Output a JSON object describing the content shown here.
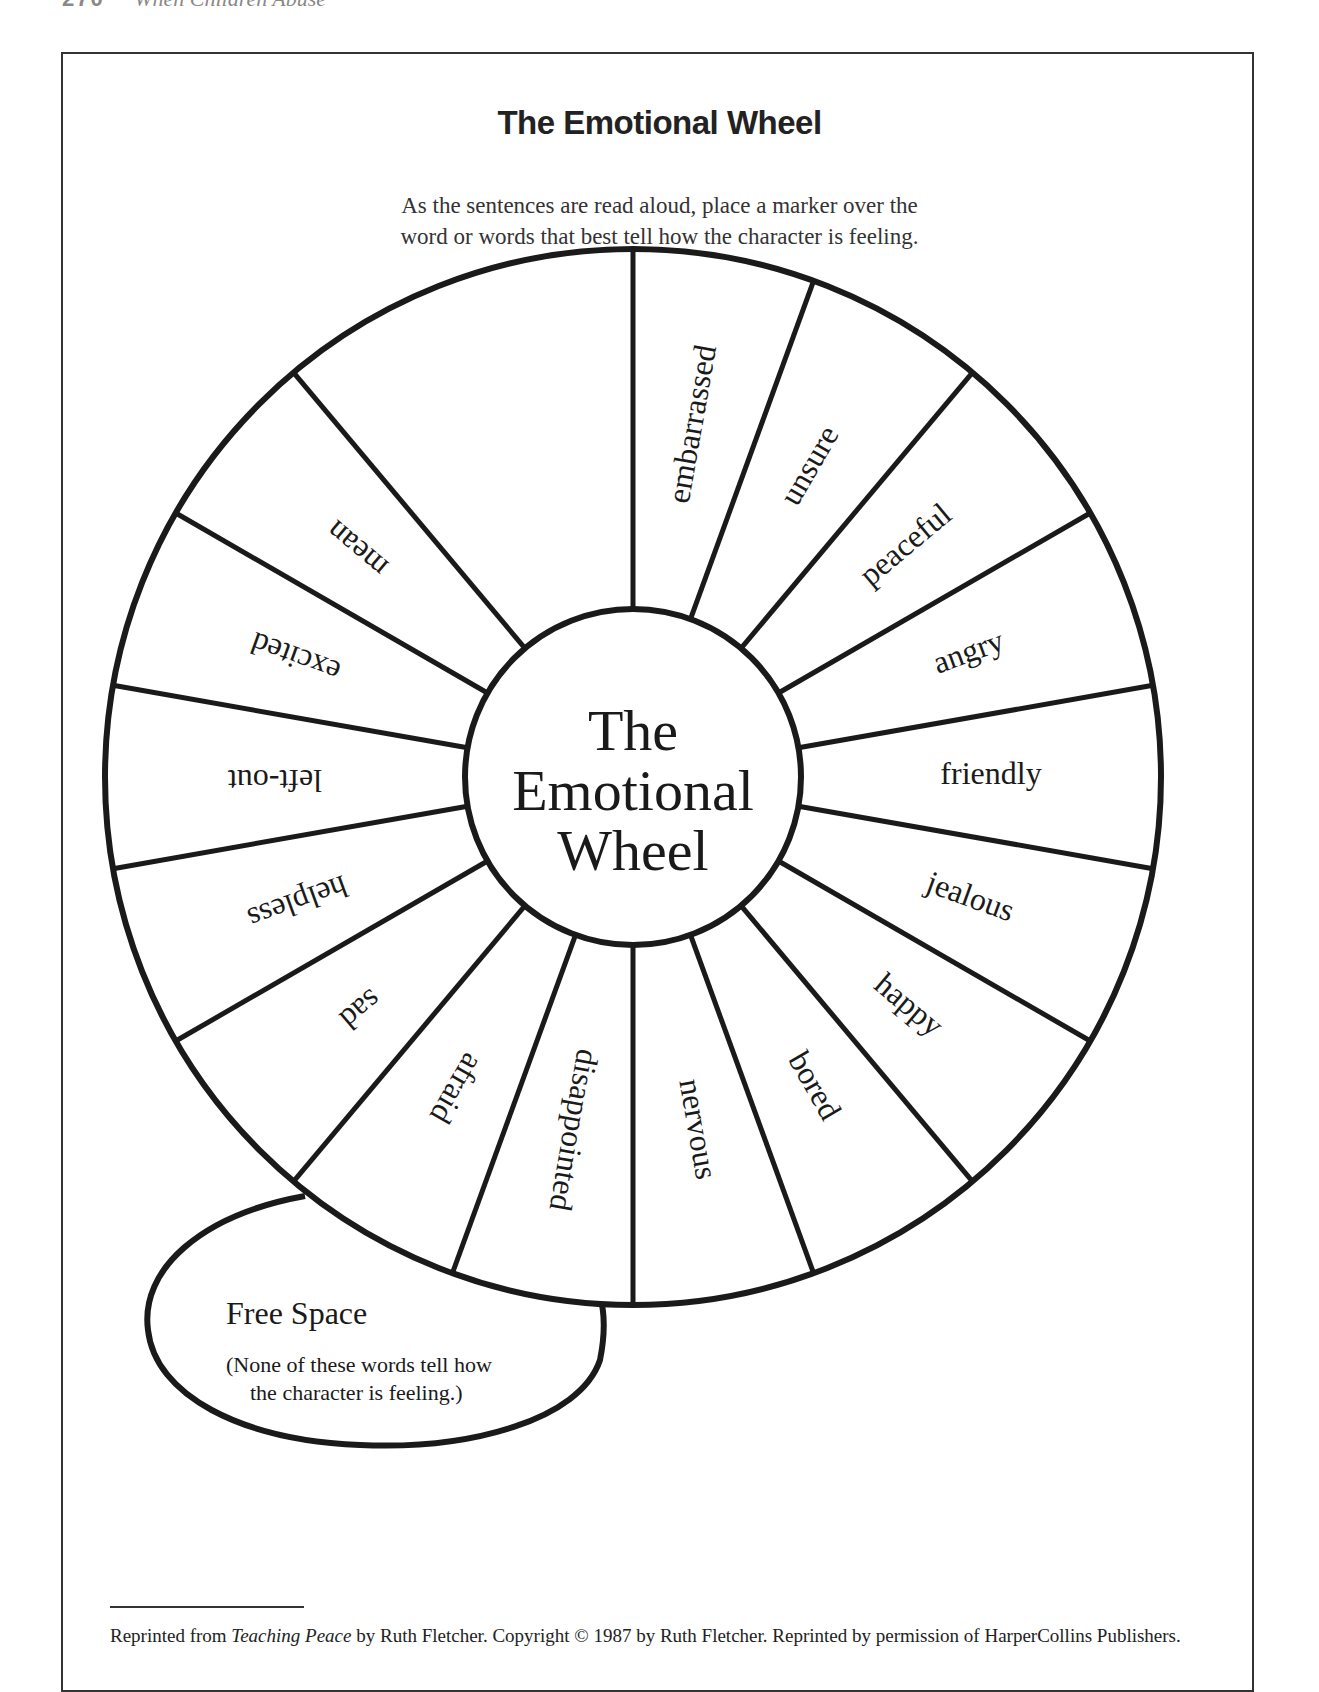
{
  "page": {
    "running_head_number": "270",
    "running_head_title": "When Children Abuse"
  },
  "worksheet": {
    "title": "The Emotional Wheel",
    "instructions_line1": "As the sentences are read aloud, place a marker over the",
    "instructions_line2": "word or words that best tell how the character is feeling."
  },
  "wheel": {
    "center_label_line1": "The",
    "center_label_line2": "Emotional",
    "center_label_line3": "Wheel",
    "center": [
      633,
      777
    ],
    "outer_radius": 528,
    "inner_radius": 168,
    "stroke_color": "#1a1a1a",
    "segments": [
      {
        "label": "embarrassed",
        "mid_angle": -80
      },
      {
        "label": "unsure",
        "mid_angle": -60
      },
      {
        "label": "peaceful",
        "mid_angle": -40
      },
      {
        "label": "angry",
        "mid_angle": -20
      },
      {
        "label": "friendly",
        "mid_angle": 0
      },
      {
        "label": "jealous",
        "mid_angle": 20
      },
      {
        "label": "happy",
        "mid_angle": 40
      },
      {
        "label": "bored",
        "mid_angle": 60
      },
      {
        "label": "nervous",
        "mid_angle": 80
      },
      {
        "label": "disappointed",
        "mid_angle": 100
      },
      {
        "label": "afraid",
        "mid_angle": 120
      },
      {
        "label": "sad",
        "mid_angle": 140
      },
      {
        "label": "helpless",
        "mid_angle": 160
      },
      {
        "label": "left-out",
        "mid_angle": 180
      },
      {
        "label": "excited",
        "mid_angle": 200
      },
      {
        "label": "mean",
        "mid_angle": 220
      }
    ]
  },
  "free_space": {
    "title": "Free Space",
    "note_line1": "(None of these words tell how",
    "note_line2": "the character is feeling.)"
  },
  "footnote": {
    "prefix": "Reprinted from ",
    "book_title": "Teaching Peace",
    "suffix": " by Ruth Fletcher. Copyright © 1987 by Ruth Fletcher. Reprinted by permission of HarperCollins Publishers."
  }
}
